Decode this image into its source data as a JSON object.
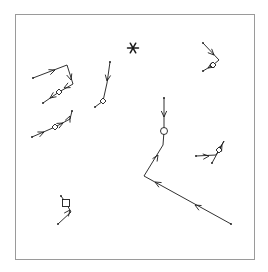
{
  "figure": {
    "type": "trajectory-vector-plot",
    "title": "",
    "background_color": "#ffffff",
    "frame": {
      "x": 15,
      "y": 14,
      "width": 240,
      "height": 246,
      "stroke_color": "#9a9a9a",
      "stroke_width": 1,
      "fill": "#ffffff"
    },
    "stroke_color": "#1a1a1a",
    "stroke_width": 0.9,
    "marker_fill": "#ffffff"
  },
  "chart_data": {
    "type": "scatter",
    "title": "",
    "xlabel": "",
    "ylabel": "",
    "grid": false,
    "legend": null,
    "xlim": [
      15,
      255
    ],
    "ylim": [
      14,
      260
    ],
    "annotations": [
      {
        "name": "asterisk-marker",
        "symbol": "asterisk",
        "x": 133,
        "y": 48,
        "size": 11
      }
    ],
    "tracks": [
      {
        "id": "track-upper-left",
        "label": "Upper-left track",
        "marker": {
          "shape": "diamond",
          "x": 59,
          "y": 92,
          "size": 6
        },
        "points": [
          [
            33,
            78
          ],
          [
            67,
            65
          ],
          [
            73,
            84
          ],
          [
            59,
            92
          ],
          [
            43,
            103
          ]
        ],
        "arrows": [
          {
            "x": 55,
            "y": 70,
            "angle": -21
          },
          {
            "x": 71,
            "y": 80,
            "angle": 73
          },
          {
            "x": 64,
            "y": 88,
            "angle": 152
          },
          {
            "x": 50,
            "y": 98,
            "angle": 145
          }
        ]
      },
      {
        "id": "track-left-diagonal",
        "label": "Left diagonal track",
        "marker": {
          "shape": "diamond",
          "x": 55,
          "y": 127,
          "size": 6
        },
        "points": [
          [
            32,
            137
          ],
          [
            55,
            127
          ],
          [
            70,
            119
          ],
          [
            72,
            111
          ]
        ],
        "arrows": [
          {
            "x": 44,
            "y": 132,
            "angle": -24
          },
          {
            "x": 63,
            "y": 123,
            "angle": -28
          },
          {
            "x": 70,
            "y": 116,
            "angle": -66
          }
        ]
      },
      {
        "id": "track-center-left",
        "label": "Center-left vertical track",
        "marker": {
          "shape": "diamond",
          "x": 103,
          "y": 101,
          "size": 6
        },
        "points": [
          [
            110,
            62
          ],
          [
            107,
            83
          ],
          [
            103,
            101
          ],
          [
            95,
            107
          ]
        ],
        "arrows": [
          {
            "x": 107,
            "y": 81,
            "angle": 99
          }
        ]
      },
      {
        "id": "track-center-main",
        "label": "Main long zigzag track",
        "marker": {
          "shape": "circle",
          "x": 164,
          "y": 131,
          "size": 7
        },
        "points": [
          [
            164,
            98
          ],
          [
            164,
            131
          ],
          [
            163,
            145
          ],
          [
            144,
            176
          ],
          [
            231,
            224
          ]
        ],
        "arrows": [
          {
            "x": 164,
            "y": 117,
            "angle": 90
          },
          {
            "x": 158,
            "y": 155,
            "angle": -58
          },
          {
            "x": 155,
            "y": 182,
            "angle": 209
          },
          {
            "x": 195,
            "y": 205,
            "angle": 209
          }
        ]
      },
      {
        "id": "track-upper-right",
        "label": "Upper-right track",
        "marker": {
          "shape": "diamond",
          "x": 213,
          "y": 65,
          "size": 6
        },
        "points": [
          [
            203,
            43
          ],
          [
            219,
            60
          ],
          [
            213,
            65
          ],
          [
            203,
            71
          ]
        ],
        "arrows": [
          {
            "x": 214,
            "y": 55,
            "angle": 45
          },
          {
            "x": 208,
            "y": 68,
            "angle": 148
          }
        ]
      },
      {
        "id": "track-right-middle",
        "label": "Right-middle track",
        "marker": {
          "shape": "diamond",
          "x": 219,
          "y": 150,
          "size": 6
        },
        "points": [
          [
            196,
            156
          ],
          [
            216,
            155
          ],
          [
            219,
            150
          ],
          [
            224,
            141
          ],
          [
            212,
            163
          ]
        ],
        "arrows": [
          {
            "x": 209,
            "y": 156,
            "angle": -6
          },
          {
            "x": 222,
            "y": 145,
            "angle": -62
          }
        ]
      },
      {
        "id": "track-bottom-left",
        "label": "Bottom-left track",
        "marker": {
          "shape": "square",
          "x": 66,
          "y": 203,
          "size": 7
        },
        "points": [
          [
            61,
            196
          ],
          [
            66,
            203
          ],
          [
            71,
            212
          ],
          [
            58,
            224
          ]
        ],
        "arrows": [
          {
            "x": 70,
            "y": 210,
            "angle": -52
          }
        ]
      }
    ]
  }
}
